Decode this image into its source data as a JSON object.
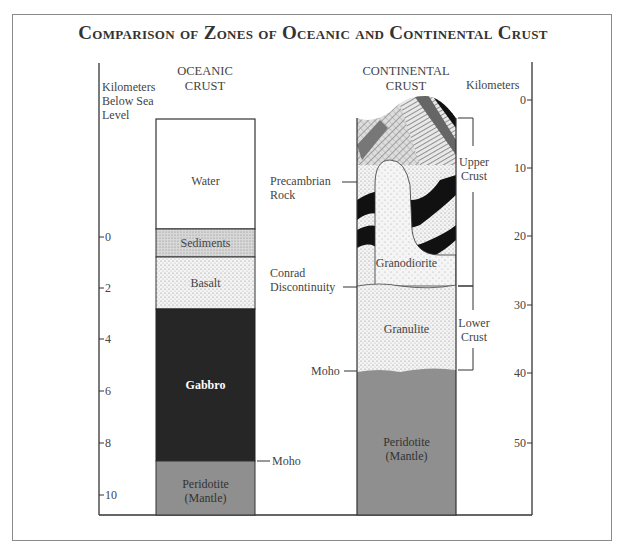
{
  "title": "Comparison of Zones of Oceanic and Continental Crust",
  "left_axis": {
    "label_line1": "Kilometers",
    "label_line2": "Below Sea",
    "label_line3": "Level",
    "ticks": [
      "0",
      "2",
      "4",
      "6",
      "8",
      "10"
    ]
  },
  "right_axis": {
    "label": "Kilometers",
    "ticks": [
      "0",
      "10",
      "20",
      "30",
      "40",
      "50"
    ]
  },
  "oceanic": {
    "header_line1": "OCEANIC",
    "header_line2": "CRUST",
    "layers": [
      {
        "name": "Water",
        "color": "#ffffff"
      },
      {
        "name": "Sediments",
        "color": "#d9d9d9"
      },
      {
        "name": "Basalt",
        "color": "#ececec"
      },
      {
        "name": "Gabbro",
        "color": "#262626"
      },
      {
        "name": "Peridotite_line1",
        "label": "Peridotite",
        "color": "#8f8f8f"
      }
    ],
    "peridotite_line2": "(Mantle)",
    "moho_label": "Moho"
  },
  "continental": {
    "header_line1": "CONTINENTAL",
    "header_line2": "CRUST",
    "precambrian_line1": "Precambrian",
    "precambrian_line2": "Rock",
    "granodiorite": "Granodiorite",
    "conrad_line1": "Conrad",
    "conrad_line2": "Discontinuity",
    "granulite": "Granulite",
    "moho_label": "Moho",
    "peridotite_line1": "Peridotite",
    "peridotite_line2": "(Mantle)",
    "upper_crust_line1": "Upper",
    "upper_crust_line2": "Crust",
    "lower_crust_line1": "Lower",
    "lower_crust_line2": "Crust"
  },
  "colors": {
    "frame": "#8a8a8a",
    "axis": "#333333",
    "gabbro": "#262626",
    "mantle": "#8f8f8f",
    "stipple": "#e8e8e8"
  }
}
